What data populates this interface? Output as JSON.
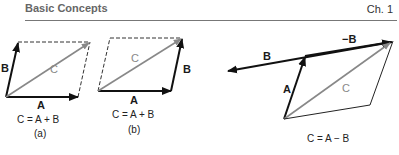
{
  "header": {
    "title": "Basic Concepts",
    "chapter": "Ch. 1"
  },
  "figures": [
    {
      "id": "a",
      "vector_labels": {
        "A": "A",
        "B": "B",
        "C": "C"
      },
      "equation": "C = A + B",
      "caption": "(a)"
    },
    {
      "id": "b",
      "vector_labels": {
        "A": "A",
        "B": "B",
        "C": "C"
      },
      "equation": "C = A + B",
      "caption": "(b)"
    },
    {
      "id": "c",
      "vector_labels": {
        "A": "A",
        "B": "B",
        "negB": "−B",
        "C": "C"
      },
      "equation": "C = A − B"
    }
  ],
  "colors": {
    "vector": "#111111",
    "resultant": "#888888",
    "dashed": "#333333"
  }
}
